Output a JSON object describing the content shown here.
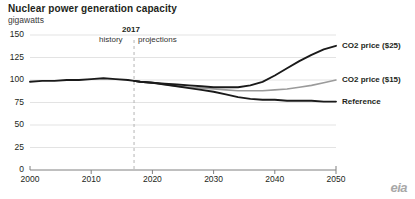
{
  "title": "Nuclear power generation capacity",
  "subtitle": "gigawatts",
  "source_logo": "eia",
  "divider": {
    "year_label": "2017",
    "left_caption": "history",
    "right_caption": "projections"
  },
  "series_labels": {
    "co2_25": "CO2 price ($25)",
    "co2_15": "CO2 price ($15)",
    "reference": "Reference"
  },
  "axis": {
    "y_ticks": [
      "0",
      "25",
      "50",
      "75",
      "100",
      "125",
      "150"
    ],
    "x_ticks": [
      "2000",
      "2010",
      "2020",
      "2030",
      "2040",
      "2050"
    ]
  },
  "colors": {
    "co2_25": "#1a1a1a",
    "co2_15": "#9b9b9b",
    "reference": "#1a1a1a",
    "grid": "#e3e3e3",
    "axis": "#808080",
    "divider": "#b5b5b5"
  },
  "chart_data": {
    "type": "line",
    "title": "Nuclear power generation capacity",
    "subtitle": "gigawatts",
    "xlabel": "",
    "ylabel": "gigawatts",
    "xlim": [
      2000,
      2050
    ],
    "ylim": [
      0,
      150
    ],
    "yticks": [
      0,
      25,
      50,
      75,
      100,
      125,
      150
    ],
    "xticks": [
      2000,
      2010,
      2020,
      2030,
      2040,
      2050
    ],
    "grid": true,
    "legend": "right-inline-labels",
    "history_projection_split": 2017,
    "annotations": [
      {
        "text": "2017",
        "x": 2017,
        "type": "divider-year"
      },
      {
        "text": "history",
        "x": 2013,
        "type": "divider-caption"
      },
      {
        "text": "projections",
        "x": 2022,
        "type": "divider-caption"
      }
    ],
    "series": [
      {
        "name": "Reference",
        "color": "#1a1a1a",
        "x": [
          2000,
          2002,
          2004,
          2006,
          2008,
          2010,
          2012,
          2014,
          2016,
          2017,
          2018,
          2020,
          2022,
          2024,
          2026,
          2028,
          2030,
          2032,
          2034,
          2036,
          2038,
          2040,
          2042,
          2044,
          2046,
          2048,
          2050
        ],
        "values": [
          98,
          99,
          99,
          100,
          100,
          101,
          102,
          101,
          100,
          99,
          98,
          97,
          95,
          93,
          91,
          89,
          87,
          84,
          81,
          79,
          78,
          78,
          77,
          77,
          77,
          76,
          76
        ]
      },
      {
        "name": "CO2 price ($15)",
        "color": "#9b9b9b",
        "x": [
          2017,
          2018,
          2020,
          2022,
          2024,
          2026,
          2028,
          2030,
          2032,
          2034,
          2036,
          2038,
          2040,
          2042,
          2044,
          2046,
          2048,
          2050
        ],
        "values": [
          99,
          98,
          97,
          95,
          93,
          92,
          91,
          90,
          89,
          88,
          88,
          88,
          89,
          90,
          92,
          94,
          97,
          100
        ]
      },
      {
        "name": "CO2 price ($25)",
        "color": "#1a1a1a",
        "x": [
          2017,
          2018,
          2020,
          2022,
          2024,
          2026,
          2028,
          2030,
          2032,
          2034,
          2036,
          2038,
          2040,
          2042,
          2044,
          2046,
          2048,
          2050
        ],
        "values": [
          99,
          98,
          97,
          96,
          95,
          94,
          93,
          92,
          92,
          92,
          94,
          98,
          105,
          113,
          121,
          128,
          134,
          138
        ]
      }
    ]
  }
}
